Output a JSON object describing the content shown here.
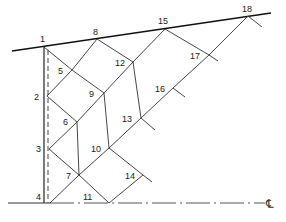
{
  "diagram": {
    "type": "characteristic-net",
    "top_boundary": {
      "from": [
        12,
        51
      ],
      "to": [
        271,
        13
      ]
    },
    "wall": {
      "solid_x": 44,
      "dashed_x": 48,
      "y_top": 47,
      "y_bottom": 203
    },
    "centerline": {
      "y": 203,
      "x_start": 8,
      "x_end": 265,
      "symbol": "℄"
    },
    "nodes": [
      {
        "id": "1",
        "label": "1",
        "x": 44,
        "y": 47,
        "lx": 40,
        "ly": 42
      },
      {
        "id": "2",
        "label": "2",
        "x": 47,
        "y": 96,
        "lx": 34,
        "ly": 100
      },
      {
        "id": "3",
        "label": "3",
        "x": 49,
        "y": 149,
        "lx": 36,
        "ly": 152
      },
      {
        "id": "4",
        "label": "4",
        "x": 50,
        "y": 203,
        "lx": 36,
        "ly": 200
      },
      {
        "id": "5",
        "label": "5",
        "x": 72,
        "y": 70,
        "lx": 58,
        "ly": 74
      },
      {
        "id": "6",
        "label": "6",
        "x": 77,
        "y": 122,
        "lx": 63,
        "ly": 125
      },
      {
        "id": "7",
        "label": "7",
        "x": 79,
        "y": 175,
        "lx": 66,
        "ly": 179
      },
      {
        "id": "8",
        "label": "8",
        "x": 97,
        "y": 39,
        "lx": 93,
        "ly": 35
      },
      {
        "id": "9",
        "label": "9",
        "x": 104,
        "y": 93,
        "lx": 89,
        "ly": 97
      },
      {
        "id": "10",
        "label": "10",
        "x": 109,
        "y": 148,
        "lx": 91,
        "ly": 152
      },
      {
        "id": "11",
        "label": "11",
        "x": 109,
        "y": 203,
        "lx": 83,
        "ly": 200
      },
      {
        "id": "12",
        "label": "12",
        "x": 133,
        "y": 62,
        "lx": 115,
        "ly": 66
      },
      {
        "id": "13",
        "label": "13",
        "x": 141,
        "y": 118,
        "lx": 122,
        "ly": 122
      },
      {
        "id": "14",
        "label": "14",
        "x": 143,
        "y": 175,
        "lx": 125,
        "ly": 179
      },
      {
        "id": "15",
        "label": "15",
        "x": 165,
        "y": 29,
        "lx": 158,
        "ly": 24
      },
      {
        "id": "16",
        "label": "16",
        "x": 173,
        "y": 88,
        "lx": 155,
        "ly": 92
      },
      {
        "id": "17",
        "label": "17",
        "x": 209,
        "y": 55,
        "lx": 190,
        "ly": 59
      },
      {
        "id": "18",
        "label": "18",
        "x": 248,
        "y": 16,
        "lx": 242,
        "ly": 12
      }
    ],
    "segments": [
      [
        "1",
        "5"
      ],
      [
        "5",
        "9"
      ],
      [
        "9",
        "10"
      ],
      [
        "10",
        "14"
      ],
      [
        "8",
        "12"
      ],
      [
        "12",
        "13"
      ],
      [
        "13",
        "13e"
      ],
      [
        "15",
        "17"
      ],
      [
        "17",
        "17e"
      ],
      [
        "18",
        "18e"
      ],
      [
        "1",
        "2"
      ],
      [
        "2",
        "6"
      ],
      [
        "6",
        "7"
      ],
      [
        "7",
        "11"
      ],
      [
        "3",
        "7"
      ],
      [
        "2",
        "5"
      ],
      [
        "5",
        "8"
      ],
      [
        "3",
        "6"
      ],
      [
        "6",
        "9"
      ],
      [
        "9",
        "12"
      ],
      [
        "12",
        "15"
      ],
      [
        "4",
        "7"
      ],
      [
        "7",
        "10"
      ],
      [
        "10",
        "13"
      ],
      [
        "13",
        "16"
      ],
      [
        "16",
        "17"
      ],
      [
        "17",
        "18"
      ],
      [
        "11",
        "14"
      ],
      [
        "14",
        "14e"
      ],
      [
        "16",
        "16e"
      ]
    ],
    "extensions": {
      "13e": [
        155,
        130
      ],
      "14e": [
        152,
        182
      ],
      "16e": [
        185,
        97
      ],
      "17e": [
        218,
        61
      ],
      "18e": [
        262,
        27
      ]
    }
  }
}
